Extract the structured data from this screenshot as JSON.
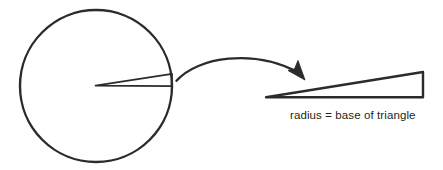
{
  "figure": {
    "caption": "radius = base of triangle",
    "colors": {
      "stroke": "#2b2b2b",
      "text": "#231f20",
      "background": "#ffffff"
    },
    "geometry": {
      "circle": {
        "center_x": 96,
        "center_y": 86,
        "radius": 76,
        "stroke_width": 2.4
      },
      "sector": {
        "apex_x": 95,
        "apex_y": 85,
        "outer_top_x": 172,
        "outer_top_y": 74,
        "outer_bottom_x": 172,
        "outer_bottom_y": 86,
        "stroke_width": 1.6
      },
      "arrow": {
        "start_x": 176,
        "start_y": 81,
        "control1_x": 205,
        "control1_y": 53,
        "control2_x": 265,
        "control2_y": 52,
        "end_x": 303,
        "end_y": 79,
        "stroke_width": 2.2
      },
      "triangle": {
        "apex_x": 266,
        "apex_y": 97,
        "top_right_x": 423,
        "top_right_y": 72,
        "bottom_right_x": 423,
        "bottom_right_y": 97,
        "stroke_width": 2.4
      },
      "caption_position": {
        "x": 290,
        "y": 119,
        "font_size": 11.5
      }
    }
  }
}
